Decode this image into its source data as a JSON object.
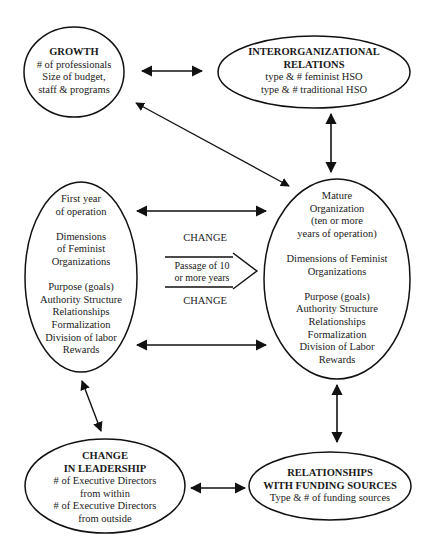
{
  "diagram": {
    "nodes": {
      "growth": {
        "title": "GROWTH",
        "lines": [
          "# of professionals",
          "Size of budget,",
          "staff & programs"
        ]
      },
      "interorganizational": {
        "title_lines": [
          "INTERORGANIZATIONAL",
          "RELATIONS"
        ],
        "lines": [
          "type & # feminist HSO",
          "type & # traditional HSO"
        ]
      },
      "first_year": {
        "header_lines": [
          "First year",
          "of operation"
        ],
        "dimension_lines": [
          "Dimensions",
          "of Feminist",
          "Organizations"
        ],
        "dimensions": [
          "Purpose (goals)",
          "Authority Structure",
          "Relationships",
          "Formalization",
          "Division of labor",
          "Rewards"
        ]
      },
      "mature": {
        "header_lines": [
          "Mature",
          "Organization",
          "(ten or more",
          "years of operation)"
        ],
        "dimension_lines": [
          "Dimensions of Feminist",
          "Organizations"
        ],
        "dimensions": [
          "Purpose (goals)",
          "Authority Structure",
          "Relationships",
          "Formalization",
          "Division of Labor",
          "Rewards"
        ]
      },
      "leadership": {
        "title_lines": [
          "CHANGE",
          "IN LEADERSHIP"
        ],
        "lines": [
          "# of Executive Directors",
          "from within",
          "# of Executive Directors",
          "from outside"
        ]
      },
      "funding": {
        "title_lines": [
          "RELATIONSHIPS",
          "WITH FUNDING SOURCES"
        ],
        "lines": [
          "Type & # of funding sources"
        ]
      }
    },
    "change_block": {
      "top_label": "CHANGE",
      "arrow_lines": [
        "Passage of 10",
        "or more years"
      ],
      "bottom_label": "CHANGE"
    },
    "edges": [
      {
        "from": "growth",
        "to": "interorganizational",
        "type": "bidirectional"
      },
      {
        "from": "growth",
        "to": "mature",
        "type": "bidirectional"
      },
      {
        "from": "interorganizational",
        "to": "mature",
        "type": "bidirectional"
      },
      {
        "from": "first_year",
        "to": "mature",
        "type": "bidirectional",
        "position": "top"
      },
      {
        "from": "first_year",
        "to": "mature",
        "type": "bidirectional",
        "position": "bottom"
      },
      {
        "from": "first_year",
        "to": "leadership",
        "type": "bidirectional"
      },
      {
        "from": "mature",
        "to": "funding",
        "type": "bidirectional"
      },
      {
        "from": "leadership",
        "to": "funding",
        "type": "bidirectional"
      }
    ],
    "colors": {
      "stroke": "#111111",
      "background": "#ffffff",
      "text": "#1a1a1a"
    }
  }
}
